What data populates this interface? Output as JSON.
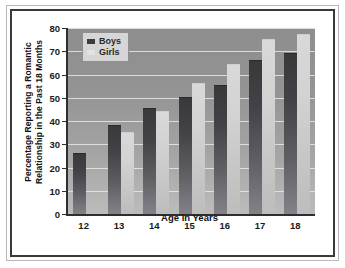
{
  "chart_data": {
    "type": "bar",
    "title": "",
    "xlabel": "Age in Years",
    "ylabel_line1": "Percentage Reporting a Romantic",
    "ylabel_line2": "Relationship in the Past 18 Months",
    "categories": [
      "12",
      "13",
      "14",
      "15",
      "16",
      "17",
      "18"
    ],
    "series": [
      {
        "name": "Boys",
        "values": [
          26,
          38,
          45,
          50,
          55,
          66,
          69
        ],
        "color": "#3c3c40"
      },
      {
        "name": "Girls",
        "values": [
          null,
          35,
          44,
          56,
          64,
          75,
          77
        ],
        "color": "#d6d6d6"
      }
    ],
    "ylim": [
      0,
      80
    ],
    "yticks": [
      "0",
      "10",
      "20",
      "30",
      "40",
      "50",
      "60",
      "70",
      "80"
    ],
    "grid": true,
    "legend_position": "top-left",
    "legend_entries": [
      "Boys",
      "Girls"
    ]
  }
}
